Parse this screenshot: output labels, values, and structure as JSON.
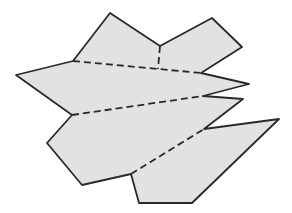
{
  "diagram": {
    "title": "",
    "colors": {
      "background": "#ffffff",
      "fill": "#e2e2e2",
      "stroke": "#2a2a2a"
    },
    "stroke_width": 1.8,
    "outline_points": "110,13 160,46 212,18 242,47 201,73 249,84 203,96 243,99 204,129 279,119 192,203 139,203 131,174 82,185 47,143 72,115 16,75 73,61",
    "fold_lines": [
      {
        "id": "fold-vertical",
        "x1": 160,
        "y1": 46,
        "x2": 158,
        "y2": 69
      },
      {
        "id": "fold-upper",
        "x1": 73,
        "y1": 61,
        "x2": 201,
        "y2": 73
      },
      {
        "id": "fold-middle",
        "x1": 72,
        "y1": 115,
        "x2": 203,
        "y2": 96
      },
      {
        "id": "fold-lower",
        "x1": 131,
        "y1": 174,
        "x2": 204,
        "y2": 129
      }
    ],
    "fold_dash": "7 4"
  }
}
